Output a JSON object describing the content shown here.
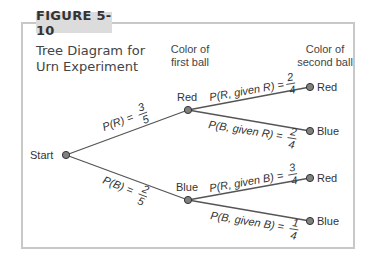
{
  "figure": {
    "tab_label": "FIGURE 5-10",
    "title_line1": "Tree Diagram for",
    "title_line2": "Urn Experiment"
  },
  "headers": {
    "first_line1": "Color of",
    "first_line2": "first ball",
    "second_line1": "Color of",
    "second_line2": "second ball"
  },
  "nodes": {
    "start": "Start",
    "first_red": "Red",
    "first_blue": "Blue",
    "rr": "Red",
    "rb": "Blue",
    "br": "Red",
    "bb": "Blue"
  },
  "edges": {
    "start_red": {
      "label": "P(R) =",
      "num": "3",
      "den": "5"
    },
    "start_blue": {
      "label": "P(B) =",
      "num": "2",
      "den": "5"
    },
    "red_red": {
      "label": "P(R, given R) =",
      "num": "2",
      "den": "4"
    },
    "red_blue": {
      "label": "P(B, given R) =",
      "num": "2",
      "den": "4"
    },
    "blue_red": {
      "label": "P(R, given B) =",
      "num": "3",
      "den": "4"
    },
    "blue_blue": {
      "label": "P(B, given B) =",
      "num": "1",
      "den": "4"
    }
  },
  "colors": {
    "line": "#555555",
    "node_fill": "#808080",
    "frame": "#c8c8c8",
    "tab_bg": "#dcdcdc"
  }
}
